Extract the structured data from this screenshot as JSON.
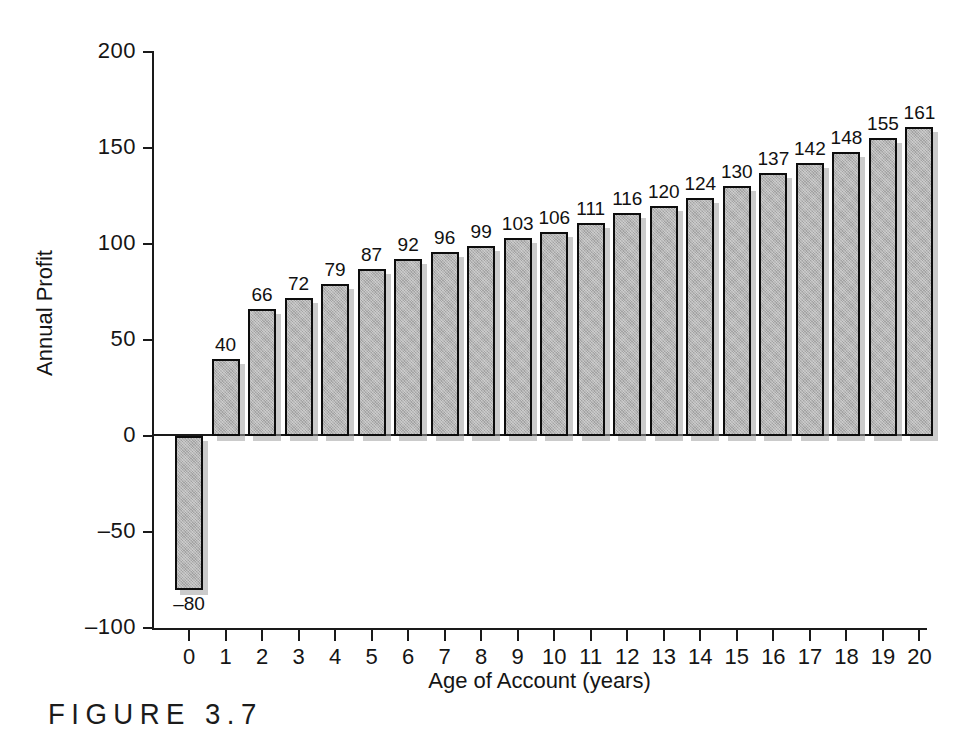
{
  "figure": {
    "caption": "FIGURE 3.7"
  },
  "chart_data": {
    "type": "bar",
    "title": "",
    "xlabel": "Age of Account (years)",
    "ylabel": "Annual Profit",
    "categories": [
      "0",
      "1",
      "2",
      "3",
      "4",
      "5",
      "6",
      "7",
      "8",
      "9",
      "10",
      "11",
      "12",
      "13",
      "14",
      "15",
      "16",
      "17",
      "18",
      "19",
      "20"
    ],
    "values": [
      -80,
      40,
      66,
      72,
      79,
      87,
      92,
      96,
      99,
      103,
      106,
      111,
      116,
      120,
      124,
      130,
      137,
      142,
      148,
      155,
      161
    ],
    "value_labels": [
      "–80",
      "40",
      "66",
      "72",
      "79",
      "87",
      "92",
      "96",
      "99",
      "103",
      "106",
      "111",
      "116",
      "120",
      "124",
      "130",
      "137",
      "142",
      "148",
      "155",
      "161"
    ],
    "ylim": [
      -100,
      200
    ],
    "yticks": [
      200,
      150,
      100,
      50,
      0,
      -50,
      -100
    ],
    "ytick_labels": [
      "200",
      "150",
      "100",
      "50",
      "0",
      "–50",
      "–100"
    ],
    "xlim": [
      -0.5,
      20.5
    ],
    "grid": false,
    "legend": null,
    "bar_fill_color": "#b5b5b5",
    "bar_edge_color": "#0d0d0d",
    "bar_shadow_color": "#a0a0a0",
    "background_color": "#ffffff",
    "text_color": "#151515"
  }
}
